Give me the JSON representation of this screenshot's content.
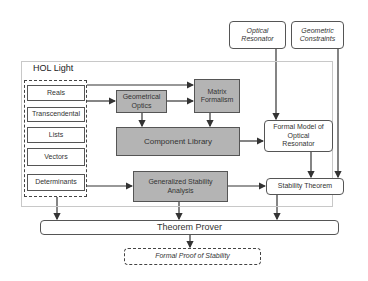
{
  "diagram": {
    "frame_label": "HOL Light",
    "inputs": {
      "optical_resonator": "Optical Resonator",
      "geometric_constraints": "Geometric Constraints"
    },
    "libraries": [
      "Reals",
      "Transcendental",
      "Lists",
      "Vectors",
      "Determinants"
    ],
    "components": {
      "geometrical_optics": "Geometrical Optics",
      "matrix_formalism": "Matrix Formalism",
      "component_library": "Component Library",
      "generalized_stability": "Generalized Stability Analysis",
      "formal_model": "Formal Model of Optical Resonator",
      "stability_theorem": "Stability Theorem"
    },
    "theorem_prover": "Theorem Prover",
    "output": "Formal Proof of Stability",
    "colors": {
      "gray_box": "#b4b4b4",
      "border": "#555555",
      "frame": "#c8c8c8"
    }
  }
}
